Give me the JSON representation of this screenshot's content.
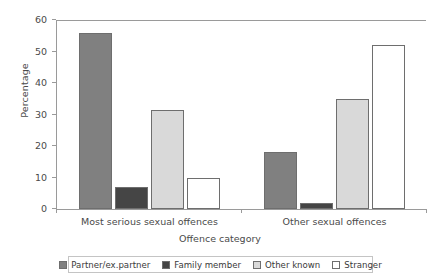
{
  "chart_data": {
    "type": "bar",
    "title": "",
    "xlabel": "Offence category",
    "ylabel": "Percentage",
    "categories": [
      "Most serious sexual offences",
      "Other sexual offences"
    ],
    "series": [
      {
        "name": "Partner/ex.partner",
        "color": "#808080",
        "values": [
          56,
          18
        ]
      },
      {
        "name": "Family member",
        "color": "#454545",
        "values": [
          7,
          2
        ]
      },
      {
        "name": "Other known",
        "color": "#d9d9d9",
        "values": [
          31.5,
          35
        ]
      },
      {
        "name": "Stranger",
        "color": "#ffffff",
        "values": [
          10,
          52
        ]
      }
    ],
    "ylim": [
      0,
      60
    ],
    "yticks": [
      0,
      10,
      20,
      30,
      40,
      50,
      60
    ],
    "ytick_labels": [
      "0",
      "10",
      "20",
      "30",
      "40",
      "50",
      "60"
    ],
    "grid": false,
    "legend_position": "bottom"
  }
}
